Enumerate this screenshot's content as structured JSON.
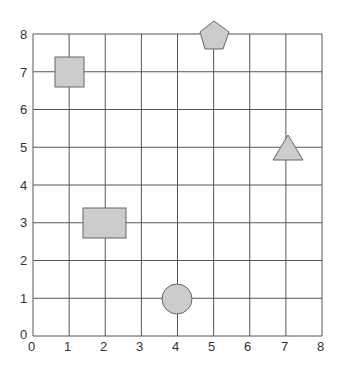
{
  "diagram": {
    "type": "coordinate-grid",
    "x_ticks": [
      "0",
      "1",
      "2",
      "3",
      "4",
      "5",
      "6",
      "7",
      "8"
    ],
    "y_ticks": [
      "0",
      "1",
      "2",
      "3",
      "4",
      "5",
      "6",
      "7",
      "8"
    ],
    "xlim": [
      0,
      8
    ],
    "ylim": [
      0,
      8
    ],
    "shapes": [
      {
        "name": "small-square",
        "shape": "square",
        "x": 1,
        "y": 7,
        "fill": "#cccccc"
      },
      {
        "name": "pentagon",
        "shape": "pentagon",
        "x": 5,
        "y": 8,
        "fill": "#cccccc"
      },
      {
        "name": "triangle",
        "shape": "triangle",
        "x": 7,
        "y": 5,
        "fill": "#cccccc"
      },
      {
        "name": "rectangle",
        "shape": "rectangle",
        "x": 2,
        "y": 3,
        "fill": "#cccccc"
      },
      {
        "name": "circle",
        "shape": "circle",
        "x": 4,
        "y": 1,
        "fill": "#cccccc"
      }
    ]
  }
}
